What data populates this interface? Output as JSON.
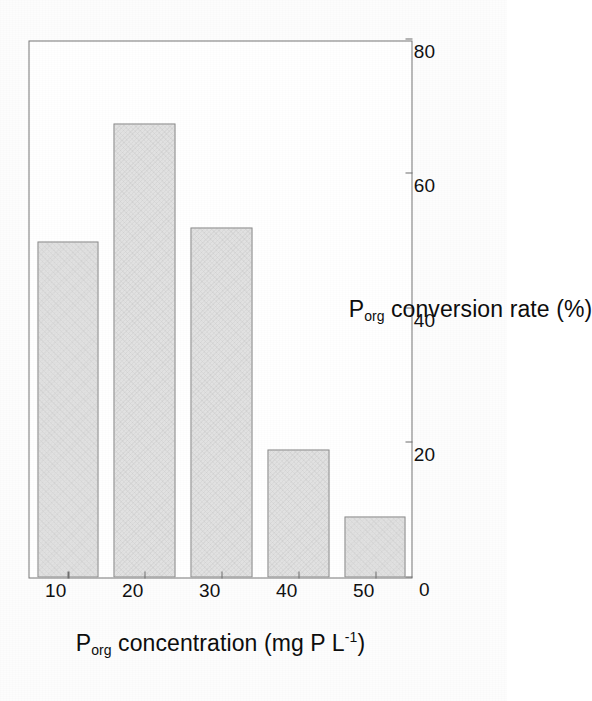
{
  "figure": {
    "background_color": "#fdfdfd",
    "page_rotation_note": "scanned figure appears rotated 90 degrees clockwise on the page",
    "bar_fill_color": "#e2e2e2",
    "bar_edge_color": "#8d8d8d",
    "frame_color": "#777777"
  },
  "chart_data": {
    "type": "bar",
    "orientation": "vertical",
    "title": "",
    "categories": [
      "10",
      "20",
      "30",
      "40",
      "50"
    ],
    "values": [
      50,
      67.5,
      52,
      19,
      9
    ],
    "xlabel": "P_org concentration (mg P L^-1)",
    "ylabel": "P_org conversion rate (%)",
    "xlabel_parts": {
      "lead": "P",
      "sub": "org",
      "rest": " concentration (mg P L",
      "sup": "-1",
      "tail": ")"
    },
    "ylabel_parts": {
      "lead": "P",
      "sub": "org",
      "rest": " conversion rate (%)"
    },
    "xticks": [
      "10",
      "20",
      "30",
      "40",
      "50"
    ],
    "yticks": [
      "0",
      "20",
      "40",
      "60",
      "80"
    ],
    "ylim": [
      0,
      80
    ],
    "xlim_categories": [
      5,
      55
    ],
    "grid": false,
    "legend": null,
    "points": [
      {
        "category": "10",
        "value": 50
      },
      {
        "category": "20",
        "value": 67.5
      },
      {
        "category": "30",
        "value": 52
      },
      {
        "category": "40",
        "value": 19
      },
      {
        "category": "50",
        "value": 9
      }
    ]
  }
}
